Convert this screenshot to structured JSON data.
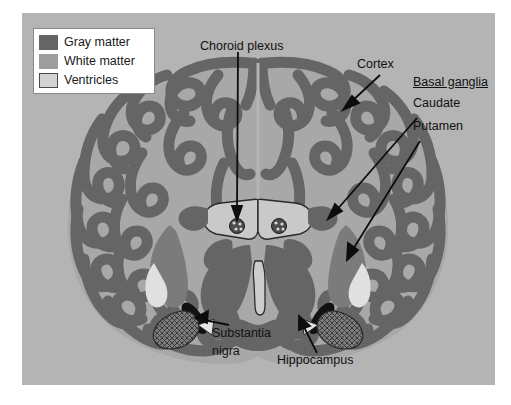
{
  "figure": {
    "panel_color": "#b4b4b4",
    "legend": {
      "items": [
        {
          "label": "Gray matter",
          "color": "#656565",
          "swatch": "gray"
        },
        {
          "label": "White matter",
          "color": "#9e9e9e",
          "swatch": "white"
        },
        {
          "label": "Ventricles",
          "color": "#d3d3d3",
          "swatch": "vent"
        }
      ]
    },
    "labels": {
      "choroid_plexus": "Choroid plexus",
      "cortex": "Cortex",
      "basal_ganglia": "Basal ganglia",
      "caudate": "Caudate",
      "putamen": "Putamen",
      "substantia_nigra_line1": "Substantia",
      "substantia_nigra_line2": "nigra",
      "hippocampus": "Hippocampus"
    },
    "colors": {
      "gray_matter": "#656565",
      "white_matter": "#a8a8a8",
      "ventricle": "#d3d3d3",
      "background": "#b4b4b4",
      "substantia_nigra": "#151515",
      "outline": "#2a2a2a",
      "arrow": "#0d0d0d",
      "pale_accent": "#e2e2e2"
    }
  }
}
